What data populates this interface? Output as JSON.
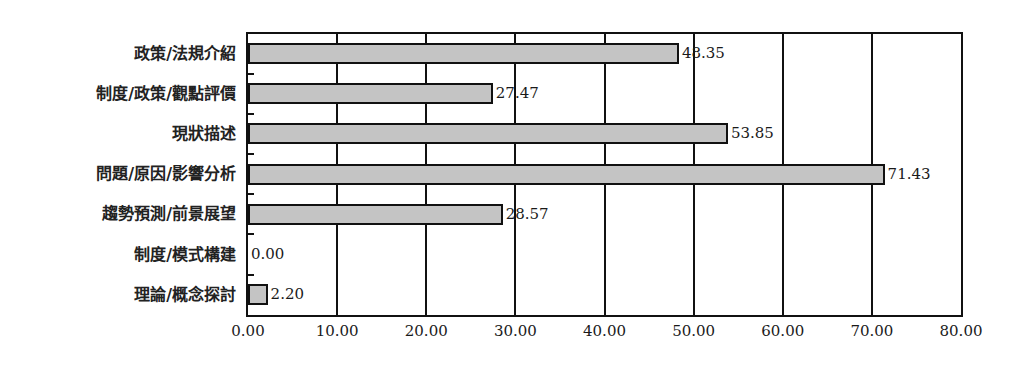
{
  "chart_data": {
    "type": "bar",
    "orientation": "horizontal",
    "title": "",
    "xlabel": "",
    "ylabel": "",
    "categories": [
      "政策/法規介紹",
      "制度/政策/觀點評價",
      "現狀描述",
      "問題/原因/影響分析",
      "趨勢預測/前景展望",
      "制度/模式構建",
      "理論/概念探討"
    ],
    "values": [
      48.35,
      27.47,
      53.85,
      71.43,
      28.57,
      0.0,
      2.2
    ],
    "value_labels": [
      "48.35",
      "27.47",
      "53.85",
      "71.43",
      "28.57",
      "0.00",
      "2.20"
    ],
    "xlim": [
      0,
      80
    ],
    "x_ticks": [
      "0.00",
      "10.00",
      "20.00",
      "30.00",
      "40.00",
      "50.00",
      "60.00",
      "70.00",
      "80.00"
    ],
    "grid": true,
    "legend": null,
    "bar_color": "#c4c4c4",
    "border_color": "#111111"
  }
}
